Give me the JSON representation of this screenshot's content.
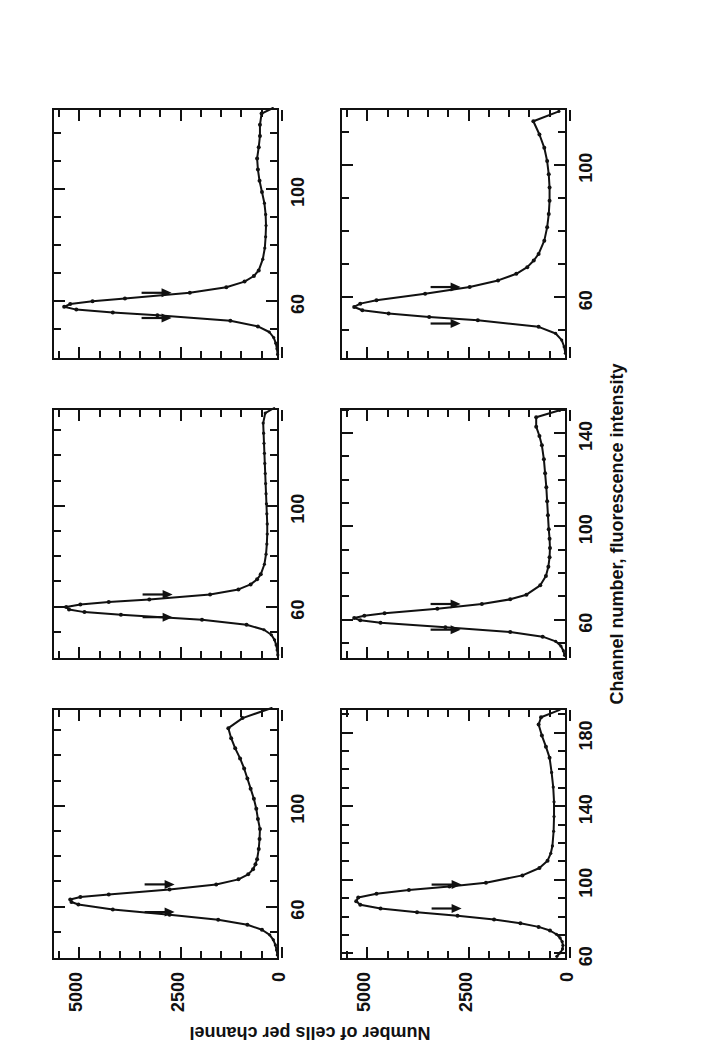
{
  "figure": {
    "xaxis_title": "Channel number, fluorescence intensity",
    "yaxis_title": "Number of cells per channel",
    "rotation": "image is rotated 90 degrees counter-clockwise"
  },
  "chart_data": {
    "type": "line",
    "title": "",
    "xlabel": "Channel number, fluorescence intensity",
    "ylabel": "Number of cells per channel",
    "ylim": [
      0,
      5600
    ],
    "yticks": [
      0,
      2500,
      5000
    ],
    "yticklabels": [
      "0",
      "2500",
      "5000"
    ],
    "grid": false,
    "legend": "none",
    "panel_layout": "2 rows x 3 columns",
    "panels": [
      {
        "name": "Mouse",
        "title": "Mouse",
        "cv_label": "CV = 5.5%",
        "cv_value": 5.5,
        "row": 0,
        "col": 0,
        "xlim": [
          40,
          140
        ],
        "xticks": [
          60,
          100
        ],
        "xticklabels": [
          "60",
          "100"
        ],
        "minor_xticks": [
          50,
          70,
          80,
          90,
          110,
          120,
          130
        ],
        "peak_channel": 64,
        "peak_value": 5150,
        "cv_bracket": [
          59,
          70
        ],
        "x": [
          42,
          44,
          46,
          48,
          50,
          52,
          54,
          56,
          58,
          60,
          62,
          63,
          64,
          65,
          66,
          68,
          70,
          72,
          74,
          76,
          78,
          80,
          84,
          88,
          92,
          96,
          100,
          104,
          108,
          112,
          116,
          120,
          124,
          128,
          132,
          136,
          140
        ],
        "y": [
          40,
          60,
          90,
          140,
          230,
          420,
          780,
          1500,
          2700,
          4100,
          4950,
          5120,
          5150,
          4900,
          4200,
          2700,
          1550,
          1000,
          760,
          640,
          580,
          540,
          500,
          480,
          470,
          520,
          560,
          620,
          700,
          780,
          860,
          960,
          1080,
          1180,
          1250,
          900,
          180
        ]
      },
      {
        "name": "Boar",
        "title": "Boar",
        "cv_label": "CV = 4.7%",
        "cv_value": 4.7,
        "row": 0,
        "col": 1,
        "xlim": [
          40,
          140
        ],
        "xticks": [
          60,
          100
        ],
        "xticklabels": [
          "60",
          "100"
        ],
        "minor_xticks": [
          50,
          70,
          80,
          90,
          110,
          120,
          130
        ],
        "peak_channel": 61,
        "peak_value": 5250,
        "cv_bracket": [
          57,
          66
        ],
        "x": [
          42,
          44,
          46,
          48,
          50,
          52,
          54,
          56,
          58,
          59,
          60,
          61,
          62,
          63,
          64,
          66,
          68,
          70,
          72,
          74,
          78,
          82,
          86,
          90,
          94,
          98,
          102,
          106,
          110,
          114,
          118,
          122,
          126,
          130,
          134,
          138,
          140
        ],
        "y": [
          30,
          45,
          70,
          110,
          190,
          370,
          800,
          1900,
          3900,
          4800,
          5180,
          5250,
          4900,
          4200,
          3200,
          1700,
          1000,
          700,
          540,
          450,
          360,
          320,
          300,
          290,
          290,
          300,
          310,
          320,
          330,
          340,
          350,
          360,
          370,
          380,
          390,
          340,
          120
        ]
      },
      {
        "name": "Hamster",
        "title": "Hamster",
        "cv_label": "CV = 4.5%",
        "cv_value": 4.5,
        "row": 0,
        "col": 2,
        "xlim": [
          40,
          130
        ],
        "xticks": [
          60,
          100
        ],
        "xticklabels": [
          "60",
          "100"
        ],
        "minor_xticks": [
          50,
          70,
          80,
          90,
          110,
          120
        ],
        "peak_channel": 59,
        "peak_value": 5300,
        "cv_bracket": [
          55,
          64
        ],
        "x": [
          42,
          44,
          46,
          48,
          50,
          52,
          54,
          56,
          57,
          58,
          59,
          60,
          61,
          62,
          64,
          66,
          68,
          70,
          72,
          76,
          80,
          84,
          88,
          92,
          96,
          100,
          104,
          108,
          112,
          116,
          120,
          124,
          128,
          130
        ],
        "y": [
          35,
          50,
          80,
          130,
          240,
          520,
          1200,
          3000,
          4100,
          5000,
          5300,
          5150,
          4600,
          3800,
          2200,
          1300,
          850,
          620,
          500,
          400,
          350,
          330,
          320,
          330,
          360,
          420,
          480,
          520,
          540,
          500,
          470,
          470,
          430,
          150
        ]
      },
      {
        "name": "Rabbit",
        "title": "Rabbit",
        "cv_label": "CV = 4.3%",
        "cv_value": 4.3,
        "row": 1,
        "col": 0,
        "xlim": [
          58,
          195
        ],
        "xticks": [
          60,
          100,
          140,
          180
        ],
        "xticklabels": [
          "60",
          "100",
          "140",
          "180"
        ],
        "minor_xticks": [
          70,
          80,
          90,
          110,
          120,
          130,
          150,
          160,
          170,
          190
        ],
        "peak_channel": 92,
        "peak_value": 5200,
        "cv_bracket": [
          86,
          99
        ],
        "x": [
          60,
          62,
          64,
          66,
          68,
          70,
          72,
          74,
          76,
          78,
          80,
          82,
          84,
          86,
          88,
          90,
          92,
          94,
          96,
          98,
          100,
          104,
          108,
          112,
          116,
          120,
          128,
          136,
          144,
          152,
          160,
          168,
          174,
          180,
          186,
          190,
          194
        ],
        "y": [
          250,
          160,
          110,
          100,
          120,
          170,
          260,
          420,
          700,
          1150,
          1800,
          2700,
          3700,
          4600,
          5100,
          5200,
          5150,
          4700,
          3900,
          2900,
          2000,
          1100,
          680,
          480,
          400,
          360,
          330,
          320,
          320,
          340,
          380,
          430,
          520,
          620,
          700,
          640,
          180
        ]
      },
      {
        "name": "Bull",
        "title": "Bull",
        "cv_label": "CV = 4.9%",
        "cv_value": 4.9,
        "row": 1,
        "col": 1,
        "xlim": [
          44,
          152
        ],
        "xticks": [
          60,
          100,
          140
        ],
        "xticklabels": [
          "60",
          "100",
          "140"
        ],
        "minor_xticks": [
          50,
          70,
          80,
          90,
          110,
          120,
          130,
          150
        ],
        "peak_channel": 62,
        "peak_value": 5250,
        "cv_bracket": [
          57,
          68
        ],
        "x": [
          46,
          48,
          50,
          52,
          54,
          56,
          58,
          60,
          61,
          62,
          63,
          64,
          66,
          68,
          70,
          72,
          76,
          80,
          84,
          88,
          92,
          96,
          100,
          106,
          112,
          118,
          124,
          130,
          136,
          140,
          144,
          148,
          151
        ],
        "y": [
          60,
          90,
          150,
          280,
          600,
          1400,
          3000,
          4600,
          5100,
          5250,
          5000,
          4500,
          3200,
          2100,
          1400,
          1000,
          660,
          520,
          460,
          430,
          420,
          430,
          450,
          470,
          490,
          510,
          540,
          570,
          620,
          680,
          760,
          760,
          180
        ]
      },
      {
        "name": "Stallion",
        "title": "Stallion",
        "cv_label": "CV = 6.1%",
        "cv_value": 6.1,
        "row": 1,
        "col": 2,
        "xlim": [
          42,
          118
        ],
        "xticks": [
          60,
          100
        ],
        "xticklabels": [
          "60",
          "100"
        ],
        "minor_xticks": [
          50,
          70,
          80,
          90,
          110
        ],
        "peak_channel": 58,
        "peak_value": 5250,
        "cv_bracket": [
          53,
          64
        ],
        "x": [
          44,
          46,
          48,
          50,
          52,
          54,
          55,
          56,
          57,
          58,
          59,
          60,
          62,
          64,
          66,
          68,
          70,
          72,
          74,
          78,
          82,
          86,
          90,
          94,
          98,
          102,
          106,
          110,
          114,
          117
        ],
        "y": [
          40,
          70,
          130,
          280,
          700,
          2200,
          3400,
          4400,
          5050,
          5250,
          5100,
          4700,
          3500,
          2400,
          1700,
          1250,
          980,
          820,
          700,
          560,
          490,
          450,
          430,
          430,
          450,
          490,
          560,
          680,
          830,
          200
        ]
      }
    ]
  }
}
